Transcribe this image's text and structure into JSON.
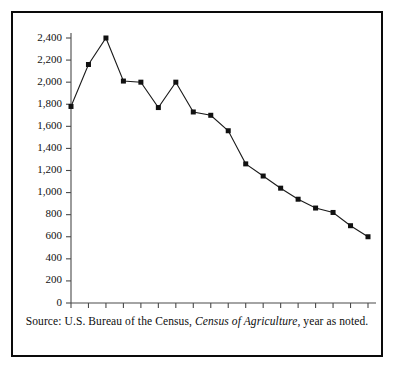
{
  "caption": {
    "prefix": "Source: U.S. Bureau of the Census,",
    "italic": "Census of Agriculture",
    "suffix": ", year as noted."
  },
  "chart_data": {
    "type": "line",
    "title": "",
    "xlabel": "",
    "ylabel": "",
    "ylim": [
      0,
      2400
    ],
    "ytick_step": 200,
    "grid": false,
    "legend": null,
    "marker": "square",
    "line_color": "#1a1a1a",
    "marker_color": "#111111",
    "ytick_labels": [
      "0",
      "200",
      "400",
      "600",
      "800",
      "1,000",
      "1,200",
      "1,400",
      "1,600",
      "1,800",
      "2,000",
      "2,200",
      "2,400"
    ],
    "ytick_values": [
      0,
      200,
      400,
      600,
      800,
      1000,
      1200,
      1400,
      1600,
      1800,
      2000,
      2200,
      2400
    ],
    "xtick_labels": [
      "1890",
      "",
      "1910",
      "",
      "1925",
      "",
      "1935",
      "",
      "1945",
      "",
      "1954",
      "",
      "1964",
      "",
      "1974",
      "",
      "1982",
      ""
    ],
    "categories": [
      "1890",
      "1900",
      "1910",
      "1920",
      "1925",
      "1930",
      "1935",
      "1940",
      "1945",
      "1950",
      "1954",
      "1959",
      "1964",
      "1969",
      "1974",
      "1978",
      "1982",
      "1987"
    ],
    "values": [
      1780,
      2160,
      2400,
      2010,
      2000,
      1770,
      2000,
      1730,
      1700,
      1560,
      1260,
      1150,
      1040,
      940,
      860,
      820,
      700,
      600
    ]
  }
}
